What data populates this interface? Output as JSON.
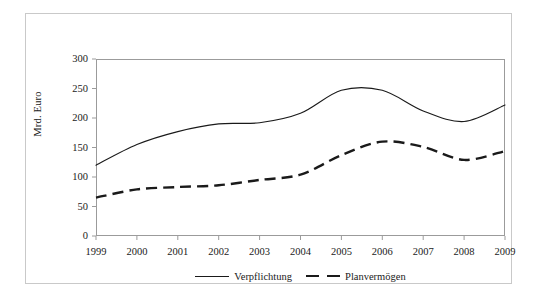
{
  "chart_data": {
    "type": "line",
    "title": "",
    "subtitle": "",
    "xlabel": "",
    "ylabel": "Mrd. Euro",
    "categories": [
      "1999",
      "2000",
      "2001",
      "2002",
      "2003",
      "2004",
      "2005",
      "2006",
      "2007",
      "2008",
      "2009"
    ],
    "x": [
      1999,
      2000,
      2001,
      2002,
      2003,
      2004,
      2005,
      2006,
      2007,
      2008,
      2009
    ],
    "series": [
      {
        "name": "Verpflichtung",
        "style": "solid",
        "color": "#1a1a1a",
        "values": [
          120,
          155,
          177,
          190,
          192,
          208,
          247,
          247,
          212,
          194,
          222
        ]
      },
      {
        "name": "Planvermögen",
        "style": "dashed",
        "color": "#1a1a1a",
        "values": [
          65,
          79,
          83,
          86,
          95,
          104,
          137,
          160,
          151,
          129,
          144
        ]
      }
    ],
    "ylim": [
      0,
      300
    ],
    "ytick_values": [
      0,
      50,
      100,
      150,
      200,
      250,
      300
    ],
    "ytick_labels": [
      "0",
      "50",
      "100",
      "150",
      "200",
      "250",
      "300"
    ],
    "grid": false,
    "legend_position": "bottom",
    "legend_entries": [
      "Verpflichtung",
      "Planvermögen"
    ]
  },
  "axes": {
    "y_title": "Mrd. Euro"
  },
  "legend": {
    "items": [
      {
        "label": "Verpflichtung",
        "style": "solid"
      },
      {
        "label": "Planvermögen",
        "style": "dashed"
      }
    ]
  }
}
